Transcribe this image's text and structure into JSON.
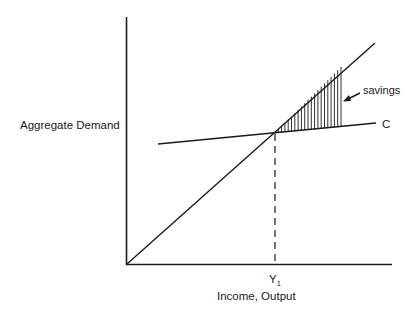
{
  "diagram": {
    "type": "keynesian-cross",
    "y_axis_label": "Aggregate Demand",
    "x_axis_label": "Income, Output",
    "equilibrium_label": "Y",
    "equilibrium_subscript": "1",
    "consumption_label": "C",
    "savings_label": "savings",
    "colors": {
      "line": "#1a1a1a",
      "background": "#ffffff"
    }
  }
}
